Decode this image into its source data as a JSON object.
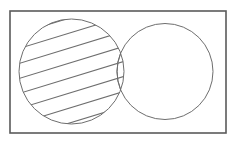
{
  "figure": {
    "background_color": "#ffffff"
  },
  "frame": {
    "name": "universal-set-rectangle",
    "x": 10,
    "y": 11,
    "width": 216,
    "height": 122,
    "stroke_color": "#5a5a5a",
    "stroke_width": 1.6,
    "fill": "none"
  },
  "circles": [
    {
      "id": "circle-left",
      "label": "A",
      "cx": 71.5,
      "cy": 71.5,
      "r": 52.5,
      "stroke_color": "#6e6e6e",
      "stroke_width": 1,
      "fill": "none",
      "shaded": true
    },
    {
      "id": "circle-right",
      "label": "B",
      "cx": 165,
      "cy": 71.5,
      "r": 48,
      "stroke_color": "#6e6e6e",
      "stroke_width": 1,
      "fill": "none",
      "shaded": false
    }
  ],
  "hatching": {
    "region": "circle-left",
    "style": "diagonal-lines",
    "angle_degrees": -17,
    "line_count": 7,
    "spacing": 15,
    "stroke_color": "#6e6e6e",
    "stroke_width": 1.1
  },
  "chart_data": {
    "type": "diagram",
    "diagram_type": "venn",
    "title": "",
    "sets": [
      {
        "name": "A",
        "position": "left",
        "shaded": true
      },
      {
        "name": "B",
        "position": "right",
        "shaded": false
      }
    ],
    "shaded_regions": [
      "A"
    ],
    "unshaded_regions": [
      "B only"
    ],
    "overlap": true,
    "universal_set_shown": true
  }
}
